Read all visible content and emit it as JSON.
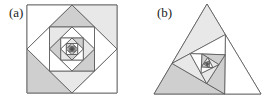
{
  "figure": {
    "panels": [
      {
        "id": "a",
        "label": "(a)",
        "shape": "square",
        "outer_vertices": [
          [
            27,
            5
          ],
          [
            117,
            5
          ],
          [
            117,
            93
          ],
          [
            27,
            93
          ]
        ],
        "fraction": 0.5,
        "levels": 11,
        "shade_light_index_start": 1,
        "shade_dark_index_start": 3
      },
      {
        "id": "b",
        "label": "(b)",
        "shape": "triangle",
        "outer_vertices": [
          [
            207,
            4
          ],
          [
            261,
            94
          ],
          [
            154,
            94
          ]
        ],
        "fraction": 0.34,
        "levels": 10
      }
    ],
    "colors": {
      "stroke": "#555555",
      "light_fill": "#e8e8e8",
      "dark_fill": "#cfcfcf",
      "background": "#ffffff"
    }
  }
}
